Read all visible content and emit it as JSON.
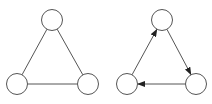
{
  "colors": {
    "background": "#ffffff",
    "stroke": "#555555",
    "node_fill": "#ffffff"
  },
  "diagrams": [
    {
      "name": "undirected-triangle-graph",
      "directed": false,
      "nodes": [
        {
          "id": "top",
          "cx": 52,
          "cy": 20,
          "r": 10.5
        },
        {
          "id": "bottom-left",
          "cx": 17,
          "cy": 84,
          "r": 10.5
        },
        {
          "id": "bottom-right",
          "cx": 88,
          "cy": 84,
          "r": 10.5
        }
      ],
      "edges": [
        {
          "from": "top",
          "to": "bottom-left"
        },
        {
          "from": "top",
          "to": "bottom-right"
        },
        {
          "from": "bottom-left",
          "to": "bottom-right"
        }
      ]
    },
    {
      "name": "directed-cycle-graph",
      "directed": true,
      "nodes": [
        {
          "id": "top",
          "cx": 162,
          "cy": 20,
          "r": 10.5
        },
        {
          "id": "bottom-left",
          "cx": 127,
          "cy": 84,
          "r": 10.5
        },
        {
          "id": "bottom-right",
          "cx": 196,
          "cy": 84,
          "r": 10.5
        }
      ],
      "edges": [
        {
          "from": "top",
          "to": "bottom-right"
        },
        {
          "from": "bottom-right",
          "to": "bottom-left"
        },
        {
          "from": "bottom-left",
          "to": "top"
        }
      ]
    }
  ]
}
